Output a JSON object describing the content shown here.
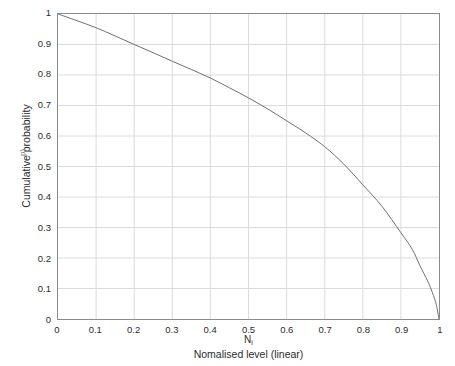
{
  "chart_data": {
    "type": "line",
    "title": "",
    "xlabel": "Nomalised level (linear)",
    "xlabel_symbol": "N",
    "xlabel_symbol_sub": "i",
    "ylabel": "Cumulative probability",
    "ylabel_artifact": "p)",
    "xlim": [
      0,
      1
    ],
    "ylim": [
      0,
      1
    ],
    "grid": true,
    "legend": null,
    "legend_position": "none",
    "line_color": "#6e6e6e",
    "grid_color": "#d8dce0",
    "frame_color": "#8a8a8a",
    "background": "#ffffff",
    "xticks": [
      "0",
      "0.1",
      "0.2",
      "0.3",
      "0.4",
      "0.5",
      "0.6",
      "0.7",
      "0.8",
      "0.9",
      "1"
    ],
    "xtick_values": [
      0,
      0.1,
      0.2,
      0.3,
      0.4,
      0.5,
      0.6,
      0.7,
      0.8,
      0.9,
      1
    ],
    "yticks": [
      "0",
      "0.1",
      "0.2",
      "0.3",
      "0.4",
      "0.5",
      "0.6",
      "0.7",
      "0.8",
      "0.9",
      "1"
    ],
    "ytick_values": [
      0,
      0.1,
      0.2,
      0.3,
      0.4,
      0.5,
      0.6,
      0.7,
      0.8,
      0.9,
      1
    ],
    "series": [
      {
        "name": "Cumulative probability",
        "x": [
          0,
          0.05,
          0.1,
          0.15,
          0.2,
          0.25,
          0.3,
          0.35,
          0.4,
          0.45,
          0.5,
          0.55,
          0.6,
          0.65,
          0.7,
          0.75,
          0.8,
          0.85,
          0.9,
          0.93,
          0.95,
          0.97,
          0.98,
          0.99,
          0.995,
          1
        ],
        "values": [
          1.0,
          0.978,
          0.955,
          0.928,
          0.9,
          0.873,
          0.845,
          0.818,
          0.79,
          0.758,
          0.725,
          0.689,
          0.65,
          0.61,
          0.565,
          0.508,
          0.44,
          0.37,
          0.283,
          0.228,
          0.175,
          0.125,
          0.095,
          0.06,
          0.035,
          0.0
        ]
      }
    ]
  }
}
